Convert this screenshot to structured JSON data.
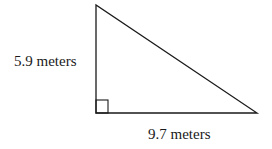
{
  "diagram": {
    "type": "right-triangle",
    "vertices": {
      "top": [
        96,
        5
      ],
      "right_angle": [
        96,
        113
      ],
      "right": [
        257,
        113
      ]
    },
    "right_angle_marker": true,
    "labels": {
      "vertical_leg": "5.9 meters",
      "horizontal_leg": "9.7 meters"
    },
    "colors": {
      "stroke": "#1a1a1a",
      "background": "#ffffff"
    }
  }
}
